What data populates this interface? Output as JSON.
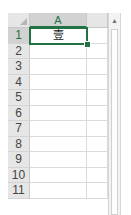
{
  "spreadsheet": {
    "columns": [
      {
        "label": "A",
        "selected": true
      },
      {
        "label": "",
        "selected": false
      }
    ],
    "rows": [
      "1",
      "2",
      "3",
      "4",
      "5",
      "6",
      "7",
      "8",
      "9",
      "10",
      "11"
    ],
    "selected_row": "1",
    "cells": {
      "A1": "壹"
    },
    "active_cell": "A1"
  },
  "scrollbar": {
    "up_arrow": "▲"
  },
  "colors": {
    "accent": "#217346",
    "header_bg": "#e6e6e6",
    "gridline": "#dadada"
  }
}
